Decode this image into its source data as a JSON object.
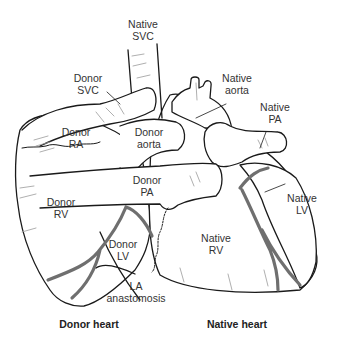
{
  "diagram": {
    "colors": {
      "outline": "#1a1a1a",
      "vessel": "#6f6f6f",
      "hatch": "#9a9a9a",
      "text": "#333333"
    },
    "labels": {
      "native_svc": {
        "line1": "Native",
        "line2": "SVC"
      },
      "donor_svc": {
        "line1": "Donor",
        "line2": "SVC"
      },
      "native_aorta": {
        "line1": "Native",
        "line2": "aorta"
      },
      "native_pa": {
        "line1": "Native",
        "line2": "PA"
      },
      "donor_ra": {
        "line1": "Donor",
        "line2": "RA"
      },
      "donor_aorta": {
        "line1": "Donor",
        "line2": "aorta"
      },
      "donor_pa": {
        "line1": "Donor",
        "line2": "PA"
      },
      "donor_rv": {
        "line1": "Donor",
        "line2": "RV"
      },
      "native_lv": {
        "line1": "Native",
        "line2": "LV"
      },
      "donor_lv": {
        "line1": "Donor",
        "line2": "LV"
      },
      "native_rv": {
        "line1": "Native",
        "line2": "RV"
      },
      "la_anastomosis": {
        "line1": "LA",
        "line2": "anastomosis"
      }
    },
    "captions": {
      "donor_heart": "Donor heart",
      "native_heart": "Native heart"
    }
  }
}
